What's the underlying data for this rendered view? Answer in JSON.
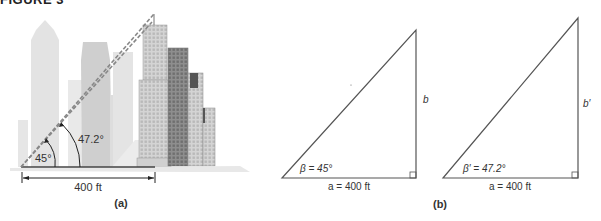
{
  "figure": {
    "title": "FIGURE 3"
  },
  "panel_a": {
    "caption": "(a)",
    "angle_small": "45°",
    "angle_large": "47.2°",
    "distance": "400 ft"
  },
  "panel_b": {
    "caption": "(b)",
    "triangle1": {
      "angle": "β = 45°",
      "base": "a = 400 ft",
      "side": "b"
    },
    "triangle2": {
      "angle": "β′ = 47.2°",
      "base": "a = 400 ft",
      "side": "b′"
    }
  },
  "colors": {
    "line": "#555555",
    "building_light": "#e2e2e2",
    "building_mid": "#c8c8c8",
    "building_dark": "#8a8a8a",
    "text": "#333333"
  }
}
